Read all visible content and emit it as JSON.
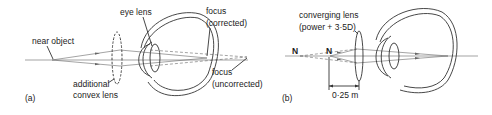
{
  "panel_a": {
    "tag": "(a)",
    "labels": {
      "near_object": "near object",
      "eye_lens": "eye lens",
      "focus_corrected_1": "focus",
      "focus_corrected_2": "(corrected)",
      "focus_uncorrected_1": "focus",
      "focus_uncorrected_2": "(uncorrected)",
      "additional_lens_1": "additional",
      "additional_lens_2": "convex lens"
    }
  },
  "panel_b": {
    "tag": "(b)",
    "labels": {
      "lens_1": "converging lens",
      "lens_2": "(power + 3·5D)",
      "point_n_far": "N",
      "point_n_near": "N",
      "distance": "0·25 m"
    }
  },
  "colors": {
    "line": "#333333",
    "ray": "#666666",
    "background": "#ffffff"
  }
}
